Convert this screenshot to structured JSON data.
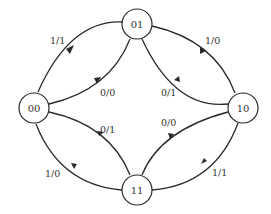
{
  "diagram": {
    "type": "state-transition-diagram",
    "nodes": [
      {
        "id": "00",
        "label": "00"
      },
      {
        "id": "01",
        "label": "01"
      },
      {
        "id": "10",
        "label": "10"
      },
      {
        "id": "11",
        "label": "11"
      }
    ],
    "edges": [
      {
        "from": "00",
        "to": "01",
        "label": "1/1"
      },
      {
        "from": "01",
        "to": "00",
        "label": "0/0"
      },
      {
        "from": "01",
        "to": "10",
        "label": "1/0"
      },
      {
        "from": "10",
        "to": "01",
        "label": "0/1"
      },
      {
        "from": "00",
        "to": "11",
        "label": "0/1"
      },
      {
        "from": "11",
        "to": "00",
        "label": "1/0"
      },
      {
        "from": "11",
        "to": "10",
        "label": "0/0"
      },
      {
        "from": "10",
        "to": "11",
        "label": "1/1"
      }
    ]
  }
}
